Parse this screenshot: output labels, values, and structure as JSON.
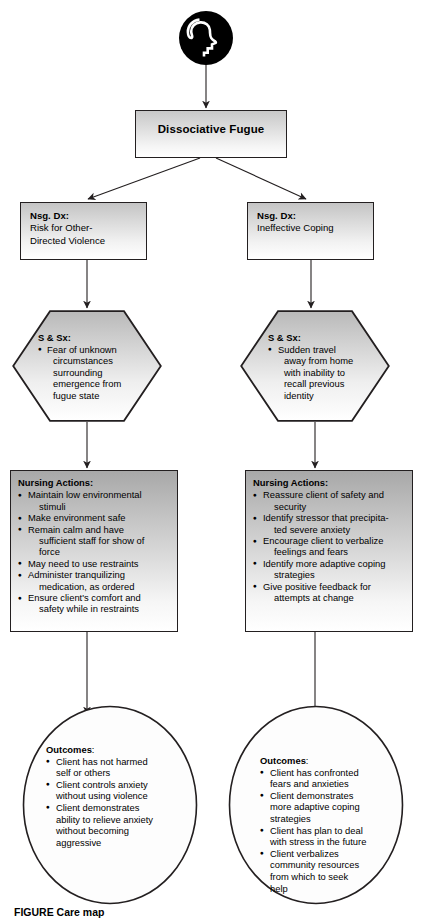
{
  "diagram": {
    "icon": {
      "name": "head-profile-icon",
      "description": "black circle with white human head profile"
    },
    "root": {
      "label": "Dissociative Fugue"
    },
    "branches": [
      {
        "side": "left",
        "diagnosis": {
          "header": "Nsg. Dx:",
          "lines": [
            "Risk for Other-",
            "Directed Violence"
          ]
        },
        "signs": {
          "header": "S & Sx:",
          "items": [
            {
              "first": "Fear of unknown",
              "rest": [
                "circumstances",
                "surrounding",
                "emergence from",
                "fugue state"
              ]
            }
          ]
        },
        "actions": {
          "header": "Nursing Actions:",
          "items": [
            {
              "first": "Maintain low environmental",
              "rest": [
                "stimuli"
              ]
            },
            {
              "first": "Make environment safe",
              "rest": []
            },
            {
              "first": "Remain calm and have",
              "rest": [
                "sufficient staff for show of",
                "force"
              ]
            },
            {
              "first": "May need to use restraints",
              "rest": []
            },
            {
              "first": "Administer tranquilizing",
              "rest": [
                "medication, as ordered"
              ]
            },
            {
              "first": "Ensure client's comfort and",
              "rest": [
                "safety while in restraints"
              ]
            }
          ]
        },
        "outcomes": {
          "header": "Outcomes",
          "header_colon": ":",
          "items": [
            {
              "first": "Client has not harmed",
              "rest": [
                "self or others"
              ]
            },
            {
              "first": "Client controls anxiety",
              "rest": [
                "without using violence"
              ]
            },
            {
              "first": "Client demonstrates",
              "rest": [
                "ability to relieve anxiety",
                "without becoming",
                "aggressive"
              ]
            }
          ]
        }
      },
      {
        "side": "right",
        "diagnosis": {
          "header": "Nsg. Dx:",
          "lines": [
            "Ineffective Coping"
          ]
        },
        "signs": {
          "header": "S & Sx:",
          "items": [
            {
              "first": "Sudden travel",
              "rest": [
                "away from home",
                "with inability to",
                "recall previous",
                "identity"
              ]
            }
          ]
        },
        "actions": {
          "header": "Nursing Actions:",
          "items": [
            {
              "first": "Reassure client of safety and",
              "rest": [
                "security"
              ]
            },
            {
              "first": "Identify stressor that precipita-",
              "rest": [
                "ted severe anxiety"
              ]
            },
            {
              "first": "Encourage client to verbalize",
              "rest": [
                "feelings and fears"
              ]
            },
            {
              "first": "Identify more adaptive coping",
              "rest": [
                "strategies"
              ]
            },
            {
              "first": "Give positive feedback for",
              "rest": [
                "attempts at change"
              ]
            }
          ]
        },
        "outcomes": {
          "header": "Outcomes",
          "header_colon": ":",
          "items": [
            {
              "first": "Client has confronted",
              "rest": [
                "fears and anxieties"
              ]
            },
            {
              "first": "Client demonstrates",
              "rest": [
                "more adaptive coping",
                "strategies"
              ]
            },
            {
              "first": "Client has plan to deal",
              "rest": [
                "with stress in the future"
              ]
            },
            {
              "first": "Client verbalizes",
              "rest": [
                "community resources",
                "from which to seek",
                "help"
              ]
            }
          ]
        }
      }
    ]
  },
  "caption": {
    "figure_label": "FIGURE",
    "text": "FIGURE    Care map"
  },
  "colors": {
    "stroke": "#231f20",
    "fill_top": "#a8a8a8",
    "fill_bottom": "#ffffff",
    "text": "#000000"
  }
}
